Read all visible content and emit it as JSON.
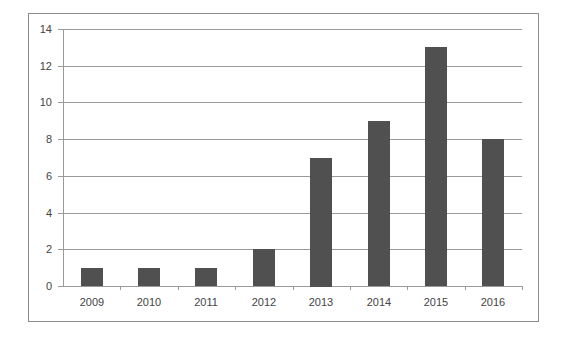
{
  "chart_data": {
    "type": "bar",
    "title": "",
    "xlabel": "",
    "ylabel": "",
    "categories": [
      "2009",
      "2010",
      "2011",
      "2012",
      "2013",
      "2014",
      "2015",
      "2016"
    ],
    "values": [
      1,
      1,
      1,
      2,
      7,
      9,
      13,
      8
    ],
    "ylim": [
      0,
      14
    ],
    "yticks": [
      "0",
      "2",
      "4",
      "6",
      "8",
      "10",
      "12",
      "14"
    ],
    "grid": true,
    "legend": "none",
    "bar_color": "#505050"
  }
}
